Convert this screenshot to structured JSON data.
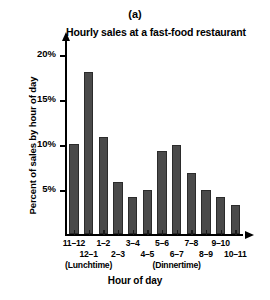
{
  "panel_label": "(a)",
  "chart_data": {
    "type": "bar",
    "title": "Hourly sales at a fast-food restaurant",
    "xlabel": "Hour of day",
    "ylabel": "Percent of sales by hour of day",
    "categories": [
      "11–12",
      "12–1",
      "1–2",
      "2–3",
      "3–4",
      "4–5",
      "5–6",
      "6–7",
      "7–8",
      "8–9",
      "9–10",
      "10–11"
    ],
    "values": [
      10.0,
      18.0,
      10.8,
      5.8,
      4.2,
      4.9,
      9.3,
      9.9,
      6.8,
      4.9,
      4.2,
      3.3
    ],
    "ylim": [
      0,
      21.5
    ],
    "ytick_values": [
      5,
      10,
      15,
      20
    ],
    "ytick_labels": [
      "5%",
      "10%",
      "15%",
      "20%"
    ],
    "grid": false,
    "legend": "none",
    "bar_color": "#4a4a4a",
    "bar_edge_color": "#2b2b2b",
    "annotations": [
      {
        "text": "(Lunchtime)",
        "category_index": 1
      },
      {
        "text": "(Dinnertime)",
        "category_index": 7
      }
    ]
  }
}
